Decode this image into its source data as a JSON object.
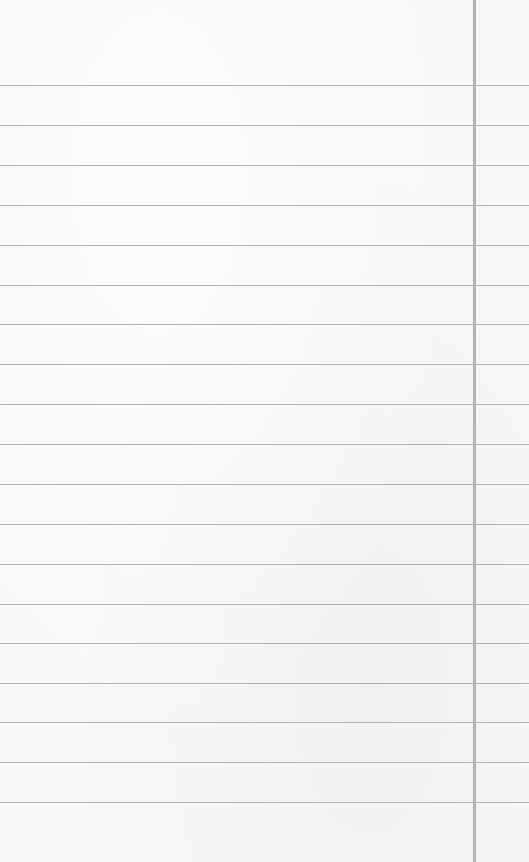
{
  "paper": {
    "type": "lined-notebook-paper",
    "background_color": "#f7f7f6",
    "rule_color": "#a9a9a9",
    "margin_line_color": "#b3b3b3",
    "margin_line_x": 473,
    "rule_positions_y": [
      85,
      125,
      165,
      205,
      245,
      285,
      324,
      364,
      404,
      444,
      484,
      524,
      564,
      604,
      643,
      683,
      722,
      762,
      802
    ],
    "text_content": ""
  }
}
